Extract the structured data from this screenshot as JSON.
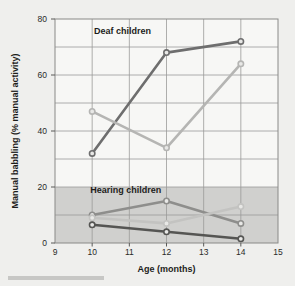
{
  "chart_data": {
    "type": "line",
    "title": "",
    "xlabel": "Age (months)",
    "ylabel": "Manual babbling (% manual activity)",
    "xlim": [
      9,
      15
    ],
    "ylim": [
      0,
      80
    ],
    "xticks": [
      9,
      10,
      11,
      12,
      13,
      14,
      15
    ],
    "yticks": [
      0,
      20,
      40,
      60,
      80
    ],
    "xtick_labels": [
      "9",
      "10",
      "11",
      "12",
      "13",
      "14",
      "15"
    ],
    "ytick_labels": [
      "0",
      "20",
      "40",
      "60",
      "80"
    ],
    "grid": true,
    "legend": "none",
    "x": [
      10,
      12,
      14
    ],
    "annotations": [
      {
        "name": "deaf-children-label",
        "text": "Deaf children",
        "x": 10.05,
        "y": 74.5
      },
      {
        "name": "hearing-children-label",
        "text": "Hearing children",
        "x": 9.95,
        "y": 18.0
      }
    ],
    "shaded_band": {
      "y0": 0,
      "y1": 20,
      "color": "#c9c9c7",
      "label": "Hearing children"
    },
    "series": [
      {
        "name": "Deaf child 1",
        "group": "Deaf children",
        "color": "#6e6e6e",
        "values": [
          32,
          68,
          72
        ]
      },
      {
        "name": "Deaf child 2",
        "group": "Deaf children",
        "color": "#b5b5b3",
        "values": [
          47,
          34,
          64
        ]
      },
      {
        "name": "Hearing child 1",
        "group": "Hearing children",
        "color": "#8e8e8c",
        "values": [
          10,
          15,
          7
        ]
      },
      {
        "name": "Hearing child 2",
        "group": "Hearing children",
        "color": "#c3c3c1",
        "values": [
          9,
          7,
          13
        ]
      },
      {
        "name": "Hearing child 3",
        "group": "Hearing children",
        "color": "#555553",
        "values": [
          6.5,
          4,
          1.5
        ]
      }
    ]
  },
  "axes": {
    "x_title": "Age (months)",
    "y_title": "Manual babbling (% manual activity)"
  }
}
